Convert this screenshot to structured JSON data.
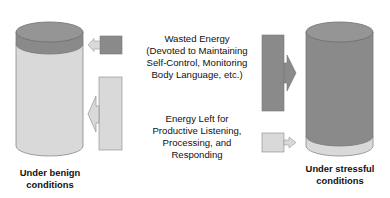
{
  "diagram": {
    "colors": {
      "wasted_energy": "#8a8a8a",
      "wasted_energy_top": "#959595",
      "energy_left": "#d9d9d9",
      "energy_left_top": "#e3e3e3",
      "outline": "#777777"
    },
    "center_labels": {
      "wasted": {
        "lines": [
          "Wasted Energy",
          "(Devoted to Maintaining",
          "Self-Control, Monitoring",
          "Body Language, etc.)"
        ]
      },
      "left": {
        "lines": [
          "Energy Left for",
          "Productive Listening,",
          "Processing, and",
          "Responding"
        ]
      }
    },
    "cylinders": [
      {
        "id": "benign",
        "caption_lines": [
          "Under benign",
          "conditions"
        ],
        "wasted_share": "small",
        "left_share": "large"
      },
      {
        "id": "stressful",
        "caption_lines": [
          "Under stressful",
          "conditions"
        ],
        "wasted_share": "large",
        "left_share": "small"
      }
    ],
    "arrows": [
      {
        "id": "benign-wasted-arrow",
        "direction": "left",
        "type": "wasted"
      },
      {
        "id": "benign-left-arrow",
        "direction": "left",
        "type": "energy-left"
      },
      {
        "id": "stressful-wasted-arrow",
        "direction": "right",
        "type": "wasted"
      },
      {
        "id": "stressful-left-arrow",
        "direction": "right",
        "type": "energy-left"
      }
    ]
  }
}
